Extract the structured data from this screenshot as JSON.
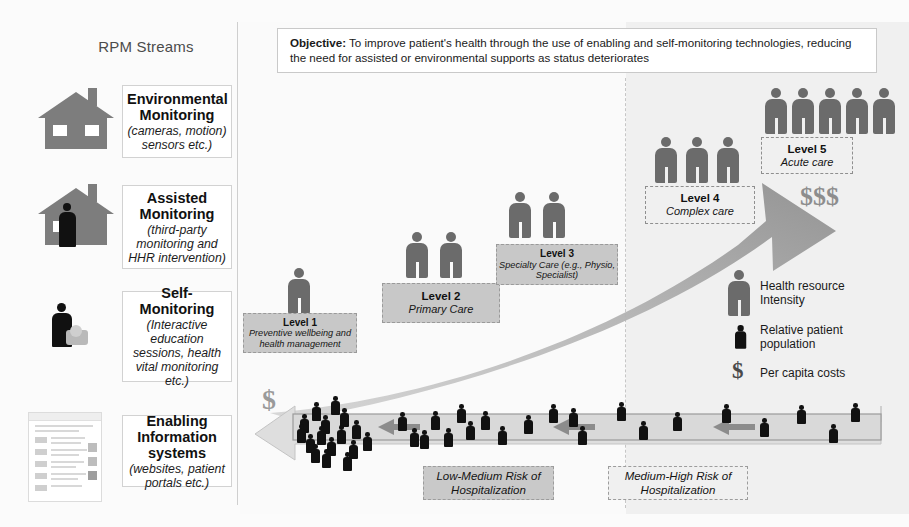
{
  "sidebar": {
    "heading": "RPM Streams",
    "streams": [
      {
        "icon": "house-icon",
        "title": "Environmental Monitoring",
        "subtitle": "(cameras, motion) sensors etc.)"
      },
      {
        "icon": "house-with-person-icon",
        "title": "Assisted Monitoring",
        "subtitle": "(third-party monitoring and HHR intervention)"
      },
      {
        "icon": "person-with-device-icon",
        "title": "Self-Monitoring",
        "subtitle": "(Interactive education sessions, health vital monitoring etc.)"
      },
      {
        "icon": "document-thumbnail-icon",
        "title": "Enabling Information systems",
        "subtitle": "(websites, patient portals etc.)"
      }
    ]
  },
  "objective": {
    "label": "Objective:",
    "text": " To improve patient's health through the use of enabling and self-monitoring technologies, reducing the need for assisted or environmental supports as status deteriorates"
  },
  "levels": [
    {
      "name": "Level 1",
      "desc": "Preventive wellbeing and health management",
      "population_figures": 1,
      "style": "filled"
    },
    {
      "name": "Level 2",
      "desc": "Primary Care",
      "population_figures": 2,
      "style": "filled"
    },
    {
      "name": "Level 3",
      "desc": "Specialty Care (e.g., Physio, Specialist)",
      "population_figures": 2,
      "style": "filled"
    },
    {
      "name": "Level 4",
      "desc": "Complex care",
      "population_figures": 3,
      "style": "open"
    },
    {
      "name": "Level 5",
      "desc": "Acute care",
      "population_figures": 5,
      "style": "open"
    }
  ],
  "risk_bands": [
    {
      "text": "Low-Medium Risk of Hospitalization",
      "style": "filled"
    },
    {
      "text": "Medium-High Risk of Hospitalization",
      "style": "open"
    }
  ],
  "cost_markers": {
    "low": "$",
    "high": "$$$"
  },
  "legend": {
    "items": [
      {
        "icon": "large-person-icon",
        "label": "Health resource Intensity"
      },
      {
        "icon": "small-person-icon",
        "label": "Relative patient population"
      },
      {
        "icon": "dollar-sign-icon",
        "label": "Per capita costs"
      }
    ]
  },
  "colors": {
    "person_gray": "#6b6b6b",
    "house_gray": "#7d7d7d",
    "box_fill": "#c8c8c8",
    "arrow_gray": "#9d9d9d",
    "band_right": "#f0f0f0"
  }
}
